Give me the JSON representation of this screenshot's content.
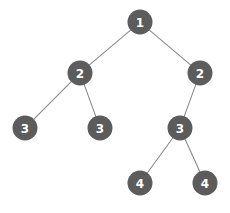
{
  "figure": {
    "width": 230,
    "height": 213,
    "background_color": "#ffffff"
  },
  "style": {
    "node_fill": "#5c5c5c",
    "node_label_color": "#ffffff",
    "edge_color": "#8a8a8a",
    "edge_width": 1.1,
    "node_radius": 12.5
  },
  "chart_data": {
    "type": "diagram",
    "diagram_kind": "binary-tree",
    "title": "",
    "nodes": [
      {
        "id": "n1",
        "label": "1",
        "x": 140,
        "y": 22,
        "depth": 0
      },
      {
        "id": "n2l",
        "label": "2",
        "x": 80,
        "y": 73,
        "depth": 1
      },
      {
        "id": "n2r",
        "label": "2",
        "x": 200,
        "y": 73,
        "depth": 1
      },
      {
        "id": "n3a",
        "label": "3",
        "x": 25,
        "y": 128,
        "depth": 2
      },
      {
        "id": "n3b",
        "label": "3",
        "x": 100,
        "y": 128,
        "depth": 2
      },
      {
        "id": "n3c",
        "label": "3",
        "x": 180,
        "y": 128,
        "depth": 2
      },
      {
        "id": "n4a",
        "label": "4",
        "x": 140,
        "y": 183,
        "depth": 3
      },
      {
        "id": "n4b",
        "label": "4",
        "x": 205,
        "y": 183,
        "depth": 3
      }
    ],
    "edges": [
      {
        "from": "n1",
        "to": "n2l"
      },
      {
        "from": "n1",
        "to": "n2r"
      },
      {
        "from": "n2l",
        "to": "n3a"
      },
      {
        "from": "n2l",
        "to": "n3b"
      },
      {
        "from": "n2r",
        "to": "n3c"
      },
      {
        "from": "n3c",
        "to": "n4a"
      },
      {
        "from": "n3c",
        "to": "n4b"
      }
    ]
  }
}
